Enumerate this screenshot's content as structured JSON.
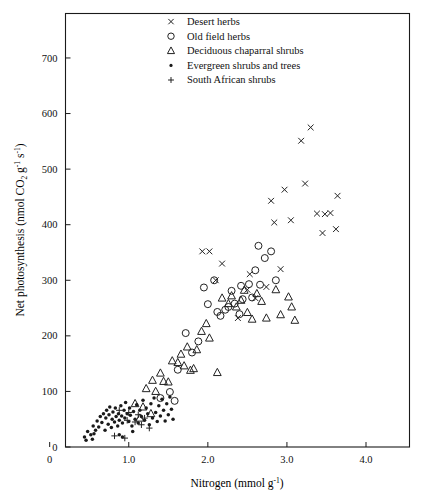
{
  "chart_data": {
    "type": "scatter",
    "title": "",
    "xlabel": "Nitrogen (mmol g⁻¹)",
    "ylabel": "Net photosynthesis (nmol CO₂ g⁻¹ s⁻¹)",
    "xlim": [
      0.2,
      4.55
    ],
    "ylim": [
      0,
      780
    ],
    "xticks": [
      0,
      1.0,
      2.0,
      3.0,
      4.0
    ],
    "xticklabels": [
      "0",
      "1.0",
      "2.0",
      "3.0",
      "4.0"
    ],
    "yticks": [
      0,
      100,
      200,
      300,
      400,
      500,
      600,
      700
    ],
    "yticklabels": [
      "0",
      "100",
      "200",
      "300",
      "400",
      "500",
      "600",
      "700"
    ],
    "grid": false,
    "legend_position": "top-center",
    "frame": true,
    "series": [
      {
        "name": "Desert herbs",
        "marker": "cross",
        "points": [
          [
            1.93,
            352
          ],
          [
            2.02,
            352
          ],
          [
            2.18,
            330
          ],
          [
            2.1,
            300
          ],
          [
            2.38,
            232
          ],
          [
            2.53,
            311
          ],
          [
            2.5,
            283
          ],
          [
            2.6,
            268
          ],
          [
            2.74,
            288
          ],
          [
            2.8,
            443
          ],
          [
            2.84,
            404
          ],
          [
            2.97,
            463
          ],
          [
            3.05,
            408
          ],
          [
            3.18,
            551
          ],
          [
            3.3,
            575
          ],
          [
            3.23,
            474
          ],
          [
            3.38,
            420
          ],
          [
            3.48,
            419
          ],
          [
            3.55,
            421
          ],
          [
            3.45,
            385
          ],
          [
            3.64,
            452
          ],
          [
            3.62,
            392
          ],
          [
            2.92,
            320
          ]
        ]
      },
      {
        "name": "Old field herbs",
        "marker": "circle",
        "points": [
          [
            1.4,
            88
          ],
          [
            1.52,
            99
          ],
          [
            1.62,
            139
          ],
          [
            1.58,
            83
          ],
          [
            1.8,
            170
          ],
          [
            1.95,
            287
          ],
          [
            2.0,
            257
          ],
          [
            2.08,
            300
          ],
          [
            2.12,
            243
          ],
          [
            2.16,
            236
          ],
          [
            2.22,
            247
          ],
          [
            2.26,
            252
          ],
          [
            2.34,
            258
          ],
          [
            2.3,
            281
          ],
          [
            2.4,
            239
          ],
          [
            2.44,
            266
          ],
          [
            2.42,
            290
          ],
          [
            2.52,
            293
          ],
          [
            2.56,
            269
          ],
          [
            2.6,
            318
          ],
          [
            2.66,
            292
          ],
          [
            2.72,
            340
          ],
          [
            2.8,
            352
          ],
          [
            2.86,
            300
          ],
          [
            2.64,
            362
          ],
          [
            1.72,
            205
          ],
          [
            1.88,
            190
          ]
        ]
      },
      {
        "name": "Deciduous chaparral shrubs",
        "marker": "triangle",
        "points": [
          [
            1.08,
            78
          ],
          [
            1.18,
            72
          ],
          [
            1.22,
            105
          ],
          [
            1.3,
            120
          ],
          [
            1.34,
            100
          ],
          [
            1.4,
            133
          ],
          [
            1.44,
            118
          ],
          [
            1.5,
            117
          ],
          [
            1.55,
            155
          ],
          [
            1.62,
            152
          ],
          [
            1.66,
            167
          ],
          [
            1.7,
            146
          ],
          [
            1.74,
            180
          ],
          [
            1.78,
            138
          ],
          [
            1.82,
            141
          ],
          [
            1.86,
            175
          ],
          [
            1.92,
            208
          ],
          [
            1.98,
            222
          ],
          [
            2.02,
            196
          ],
          [
            2.18,
            268
          ],
          [
            2.26,
            258
          ],
          [
            2.3,
            272
          ],
          [
            2.36,
            252
          ],
          [
            2.42,
            264
          ],
          [
            2.46,
            282
          ],
          [
            2.5,
            242
          ],
          [
            2.56,
            230
          ],
          [
            2.62,
            276
          ],
          [
            2.68,
            262
          ],
          [
            2.74,
            232
          ],
          [
            2.86,
            283
          ],
          [
            2.92,
            238
          ],
          [
            3.02,
            270
          ],
          [
            3.06,
            252
          ],
          [
            3.1,
            228
          ],
          [
            2.12,
            134
          ],
          [
            1.28,
            60
          ],
          [
            1.14,
            52
          ]
        ]
      },
      {
        "name": "Evergreen shrubs and trees",
        "marker": "dot",
        "points": [
          [
            0.44,
            18
          ],
          [
            0.48,
            28
          ],
          [
            0.52,
            22
          ],
          [
            0.55,
            38
          ],
          [
            0.58,
            30
          ],
          [
            0.6,
            47
          ],
          [
            0.62,
            36
          ],
          [
            0.64,
            55
          ],
          [
            0.66,
            44
          ],
          [
            0.68,
            60
          ],
          [
            0.7,
            30
          ],
          [
            0.71,
            52
          ],
          [
            0.72,
            66
          ],
          [
            0.74,
            41
          ],
          [
            0.75,
            58
          ],
          [
            0.76,
            72
          ],
          [
            0.78,
            35
          ],
          [
            0.79,
            50
          ],
          [
            0.8,
            63
          ],
          [
            0.82,
            45
          ],
          [
            0.83,
            70
          ],
          [
            0.84,
            55
          ],
          [
            0.86,
            38
          ],
          [
            0.87,
            60
          ],
          [
            0.88,
            48
          ],
          [
            0.9,
            74
          ],
          [
            0.91,
            56
          ],
          [
            0.92,
            43
          ],
          [
            0.94,
            66
          ],
          [
            0.95,
            52
          ],
          [
            0.96,
            80
          ],
          [
            0.98,
            60
          ],
          [
            1.0,
            46
          ],
          [
            1.01,
            70
          ],
          [
            1.02,
            57
          ],
          [
            1.04,
            38
          ],
          [
            1.06,
            64
          ],
          [
            1.08,
            50
          ],
          [
            1.1,
            76
          ],
          [
            1.12,
            43
          ],
          [
            1.14,
            66
          ],
          [
            1.16,
            55
          ],
          [
            1.18,
            84
          ],
          [
            1.2,
            48
          ],
          [
            1.22,
            70
          ],
          [
            1.24,
            60
          ],
          [
            1.26,
            40
          ],
          [
            1.28,
            78
          ],
          [
            1.3,
            52
          ],
          [
            1.32,
            88
          ],
          [
            1.34,
            62
          ],
          [
            1.36,
            46
          ],
          [
            1.38,
            74
          ],
          [
            1.4,
            56
          ],
          [
            1.42,
            86
          ],
          [
            1.44,
            66
          ],
          [
            1.46,
            47
          ],
          [
            1.48,
            78
          ],
          [
            1.5,
            58
          ],
          [
            1.52,
            90
          ],
          [
            1.54,
            68
          ],
          [
            1.56,
            50
          ],
          [
            0.46,
            12
          ],
          [
            0.54,
            14
          ],
          [
            0.56,
            24
          ],
          [
            0.88,
            22
          ],
          [
            1.05,
            28
          ],
          [
            0.92,
            18
          ]
        ]
      },
      {
        "name": "South African shrubs",
        "marker": "plus",
        "points": [
          [
            0.82,
            20
          ],
          [
            0.95,
            16
          ],
          [
            1.0,
            62
          ],
          [
            1.08,
            45
          ],
          [
            1.12,
            58
          ],
          [
            1.16,
            40
          ],
          [
            1.2,
            52
          ],
          [
            0.88,
            66
          ],
          [
            1.26,
            34
          ],
          [
            0.98,
            48
          ]
        ]
      }
    ]
  },
  "legend": {
    "items": [
      {
        "marker": "cross",
        "label": "Desert herbs"
      },
      {
        "marker": "circle",
        "label": "Old field herbs"
      },
      {
        "marker": "triangle",
        "label": "Deciduous chaparral shrubs"
      },
      {
        "marker": "dot",
        "label": "Evergreen shrubs and trees"
      },
      {
        "marker": "plus",
        "label": "South African shrubs"
      }
    ]
  },
  "axis": {
    "y_title_parts": {
      "main": "Net photosynthesis (nmol CO",
      "sub2": "2",
      "g": " g",
      "supm1a": "-1",
      "s": " s",
      "supm1b": "-1",
      "close": ")"
    },
    "x_title_parts": {
      "main": "Nitrogen (mmol g",
      "supm1": "-1",
      "close": ")"
    }
  }
}
